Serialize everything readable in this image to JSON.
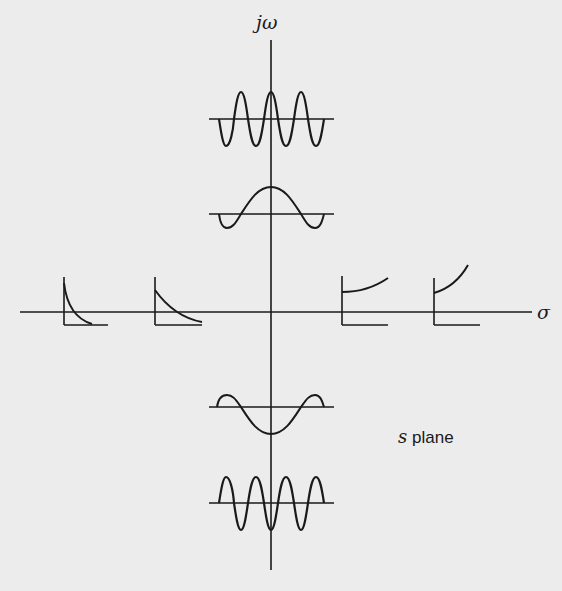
{
  "diagram": {
    "title": "s plane",
    "axes": {
      "vertical_label": "jω",
      "horizontal_label": "σ"
    },
    "plane_label": {
      "variable": "s",
      "word": "plane"
    },
    "colors": {
      "background": "#ececec",
      "ink": "#1a1a1a"
    },
    "insets": [
      {
        "id": "left-far",
        "position": "negative real axis (far)",
        "behavior": "fast exponential decay"
      },
      {
        "id": "left-near",
        "position": "negative real axis (near)",
        "behavior": "slow exponential decay"
      },
      {
        "id": "right-near",
        "position": "positive real axis (near)",
        "behavior": "slow exponential growth"
      },
      {
        "id": "right-far",
        "position": "positive real axis (far)",
        "behavior": "fast exponential growth"
      },
      {
        "id": "upper-far",
        "position": "positive imaginary axis (far)",
        "behavior": "high-frequency cosine"
      },
      {
        "id": "upper-near",
        "position": "positive imaginary axis (near)",
        "behavior": "low-frequency cosine"
      },
      {
        "id": "lower-near",
        "position": "negative imaginary axis (near)",
        "behavior": "low-frequency negative cosine"
      },
      {
        "id": "lower-far",
        "position": "negative imaginary axis (far)",
        "behavior": "high-frequency negative cosine"
      }
    ]
  }
}
